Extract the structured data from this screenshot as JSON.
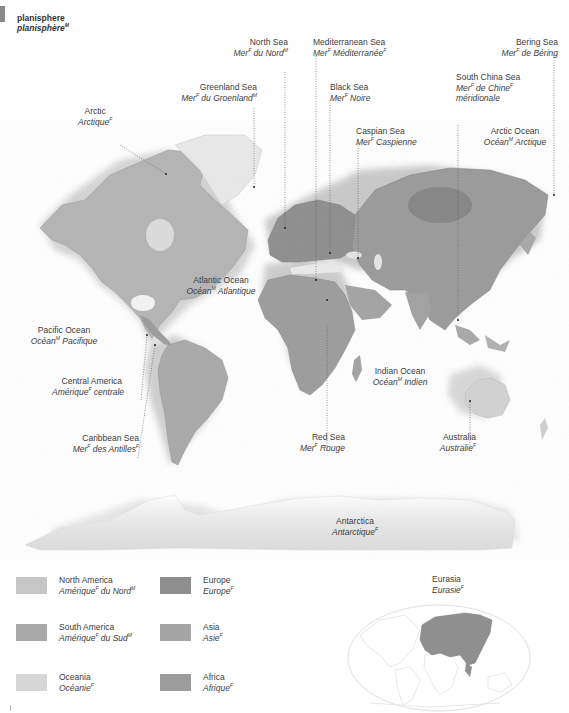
{
  "header": {
    "title_en": "planisphere",
    "title_fr": "planisphère",
    "title_fr_gender": "M"
  },
  "map": {
    "labels": [
      {
        "id": "arctic",
        "en": "Arctic",
        "fr": "Arctique",
        "gender": "F"
      },
      {
        "id": "greenland-sea",
        "en": "Greenland Sea",
        "fr": "Mer",
        "fr_gender": "F",
        "fr_rest": " du Groenland",
        "gender": "M"
      },
      {
        "id": "north-sea",
        "en": "North Sea",
        "fr": "Mer",
        "fr_gender": "F",
        "fr_rest": " du Nord",
        "gender": "M"
      },
      {
        "id": "mediterranean-sea",
        "en": "Mediterranean Sea",
        "fr": "Mer",
        "fr_gender": "F",
        "fr_rest": " Méditerranée",
        "gender": "F"
      },
      {
        "id": "black-sea",
        "en": "Black Sea",
        "fr": "Mer",
        "fr_gender": "F",
        "fr_rest": " Noire",
        "gender": ""
      },
      {
        "id": "caspian-sea",
        "en": "Caspian Sea",
        "fr": "Mer",
        "fr_gender": "F",
        "fr_rest": " Caspienne",
        "gender": ""
      },
      {
        "id": "south-china-sea",
        "en": "South China Sea",
        "fr": "Mer",
        "fr_gender": "F",
        "fr_rest": " de Chine",
        "gender": "F",
        "fr_line2": "méridionale"
      },
      {
        "id": "bering-sea",
        "en": "Bering Sea",
        "fr": "Mer",
        "fr_gender": "F",
        "fr_rest": " de Béring",
        "gender": ""
      },
      {
        "id": "arctic-ocean",
        "en": "Arctic Ocean",
        "fr": "Océan",
        "fr_gender": "M",
        "fr_rest": " Arctique",
        "gender": ""
      },
      {
        "id": "atlantic-ocean",
        "en": "Atlantic Ocean",
        "fr": "Océan",
        "fr_gender": "M",
        "fr_rest": " Atlantique",
        "gender": ""
      },
      {
        "id": "pacific-ocean",
        "en": "Pacific Ocean",
        "fr": "Océan",
        "fr_gender": "M",
        "fr_rest": " Pacifique",
        "gender": ""
      },
      {
        "id": "central-america",
        "en": "Central America",
        "fr": "Amérique",
        "fr_gender": "F",
        "fr_rest": " centrale",
        "gender": ""
      },
      {
        "id": "caribbean-sea",
        "en": "Caribbean Sea",
        "fr": "Mer",
        "fr_gender": "F",
        "fr_rest": " des Antilles",
        "gender": "F"
      },
      {
        "id": "indian-ocean",
        "en": "Indian Ocean",
        "fr": "Océan",
        "fr_gender": "M",
        "fr_rest": " Indien",
        "gender": ""
      },
      {
        "id": "red-sea",
        "en": "Red Sea",
        "fr": "Mer",
        "fr_gender": "F",
        "fr_rest": " Rouge",
        "gender": ""
      },
      {
        "id": "australia",
        "en": "Australia",
        "fr": "Australie",
        "gender": "F"
      },
      {
        "id": "antarctica",
        "en": "Antarctica",
        "fr": "Antarctique",
        "gender": "F"
      }
    ]
  },
  "legend": {
    "items": [
      {
        "en": "North America",
        "fr": "Amérique",
        "fr_gender": "F",
        "fr_rest": " du Nord",
        "gender": "M",
        "color": "#c6c6c6"
      },
      {
        "en": "South America",
        "fr": "Amérique",
        "fr_gender": "F",
        "fr_rest": " du Sud",
        "gender": "M",
        "color": "#a9a9a9"
      },
      {
        "en": "Oceania",
        "fr": "Océanie",
        "gender": "F",
        "color": "#d6d6d6"
      },
      {
        "en": "Europe",
        "fr": "Europe",
        "gender": "F",
        "color": "#8e8e8e"
      },
      {
        "en": "Asia",
        "fr": "Asie",
        "gender": "F",
        "color": "#a4a4a4"
      },
      {
        "en": "Africa",
        "fr": "Afrique",
        "gender": "F",
        "color": "#9c9c9c"
      }
    ]
  },
  "inset": {
    "title_en": "Eurasia",
    "title_fr": "Eurasie",
    "title_gender": "F",
    "highlight_color": "#8f8f8f"
  }
}
